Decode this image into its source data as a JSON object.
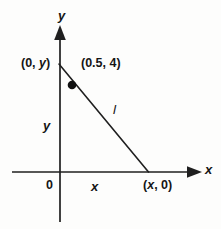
{
  "figure": {
    "background_color": "#fdfdfc",
    "stroke_color": "#1a1a1a",
    "axes": {
      "y_axis_label": "y",
      "x_axis_label": "x",
      "origin_label": "0"
    },
    "labels": {
      "y_intercept_point": "(0, y)",
      "marked_point": "(0.5, 4)",
      "x_intercept_point": "(x, 0)",
      "line_name": "l",
      "y_segment": "y",
      "x_segment": "x"
    }
  },
  "chart_data": {
    "type": "scatter",
    "title": "",
    "xlabel": "x",
    "ylabel": "y",
    "grid": false,
    "legend": null,
    "annotations": [
      {
        "text": "(0, y)",
        "role": "y-intercept-label"
      },
      {
        "text": "(0.5, 4)",
        "role": "point-label"
      },
      {
        "text": "(x, 0)",
        "role": "x-intercept-label"
      },
      {
        "text": "l",
        "role": "line-label"
      },
      {
        "text": "y",
        "role": "y-leg-label"
      },
      {
        "text": "x",
        "role": "x-leg-label"
      },
      {
        "text": "0",
        "role": "origin-label"
      }
    ],
    "series": [
      {
        "name": "line l",
        "type": "line",
        "points": [
          {
            "x": 0,
            "y": "y"
          },
          {
            "x": "x",
            "y": 0
          }
        ]
      },
      {
        "name": "marked point",
        "type": "scatter",
        "points": [
          {
            "x": 0.5,
            "y": 4
          }
        ]
      }
    ]
  },
  "geometry": {
    "x_axis": {
      "x1": 12,
      "y1": 172,
      "x2": 198,
      "y2": 172
    },
    "y_axis": {
      "x1": 60,
      "y1": 28,
      "x2": 60,
      "y2": 222
    },
    "line_l": {
      "x1": 60,
      "y1": 65,
      "x2": 148,
      "y2": 172
    },
    "dot": {
      "cx": 72,
      "cy": 85,
      "r": 4.2
    }
  }
}
